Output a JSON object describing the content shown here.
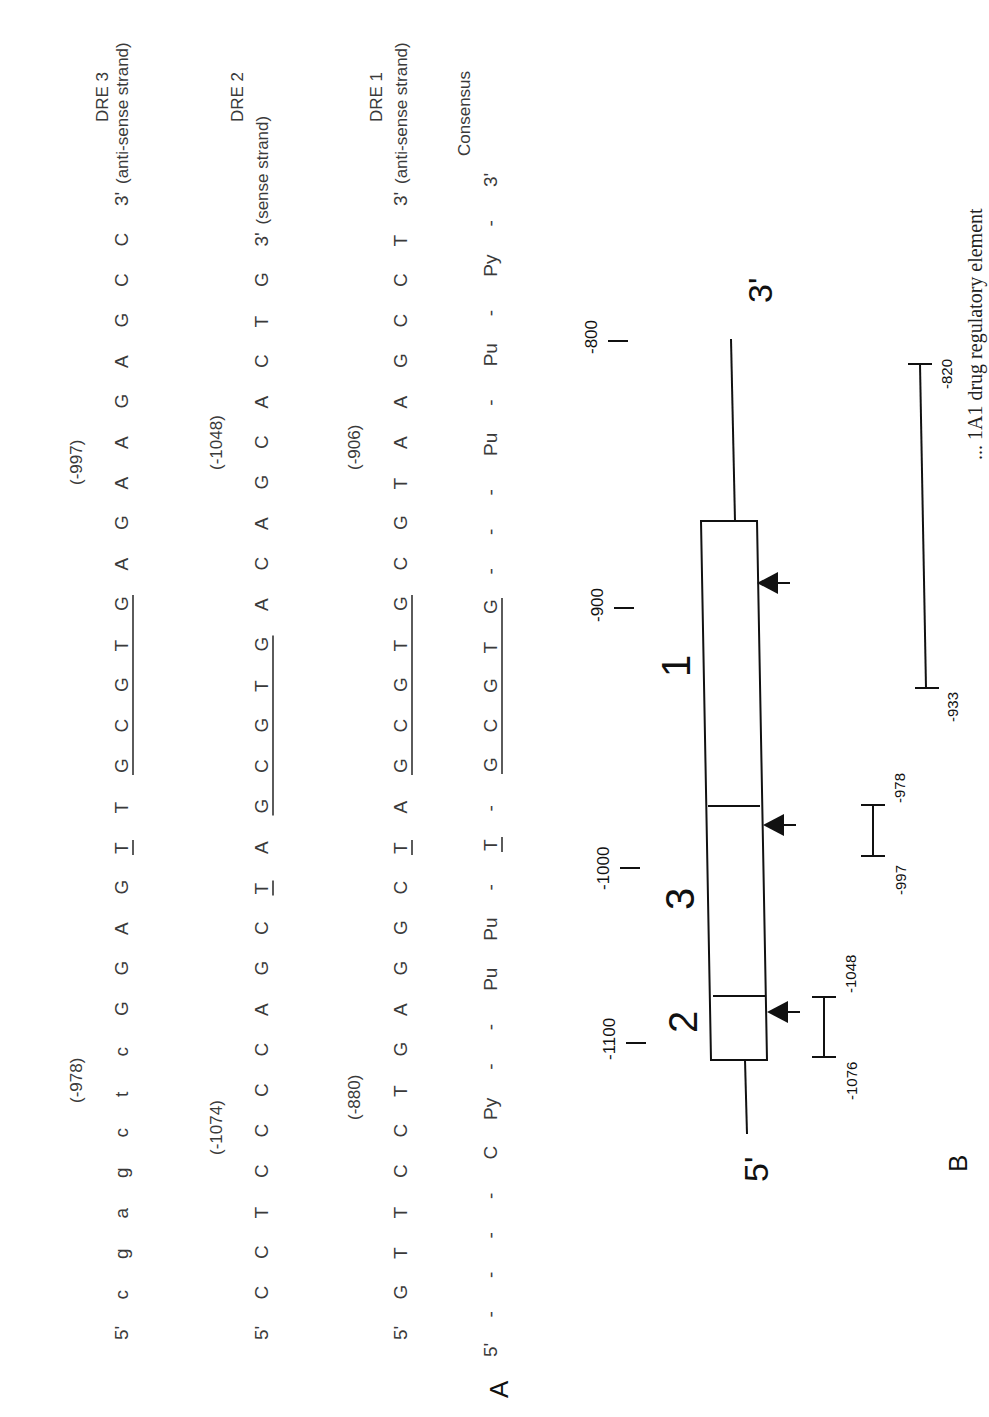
{
  "panel_a": {
    "label": "A",
    "rows": [
      {
        "name": "DRE 3",
        "prefix": "5'",
        "bases": [
          "c",
          "g",
          "a",
          "g",
          "c",
          "t",
          "c",
          "G",
          "G",
          "A",
          "G",
          "T",
          "T",
          "G",
          "C",
          "G",
          "T",
          "G",
          "A",
          "G",
          "A",
          "A",
          "G",
          "A",
          "G",
          "C",
          "C"
        ],
        "underlined_single_index": 11,
        "underlined_core": [
          13,
          17
        ],
        "suffix": "3'",
        "strand": "(anti-sense strand)",
        "pos_start": "(-978)",
        "pos_end": "(-997)"
      },
      {
        "name": "DRE 2",
        "prefix": "5'",
        "bases": [
          "C",
          "C",
          "T",
          "C",
          "C",
          "C",
          "C",
          "A",
          "G",
          "C",
          "T",
          "A",
          "G",
          "C",
          "G",
          "T",
          "G",
          "A",
          "C",
          "A",
          "G",
          "C",
          "A",
          "C",
          "T",
          "G"
        ],
        "underlined_single_index": 10,
        "underlined_core": [
          12,
          16
        ],
        "suffix": "3'",
        "strand": "(sense strand)",
        "pos_start": "(-1074)",
        "pos_end": "(-1048)"
      },
      {
        "name": "DRE 1",
        "prefix": "5'",
        "bases": [
          "G",
          "T",
          "T",
          "C",
          "C",
          "T",
          "G",
          "A",
          "G",
          "G",
          "C",
          "T",
          "A",
          "G",
          "C",
          "G",
          "T",
          "G",
          "C",
          "G",
          "T",
          "A",
          "A",
          "G",
          "C",
          "C",
          "T"
        ],
        "underlined_single_index": 11,
        "underlined_core": [
          13,
          17
        ],
        "suffix": "3'",
        "strand": "(anti-sense strand)",
        "pos_start": "(-880)",
        "pos_end": "(-906)"
      },
      {
        "name": "Consensus",
        "prefix": "5'",
        "bases": [
          "-",
          "-",
          "-",
          "-",
          "C",
          "Py",
          "-",
          "-",
          "Pu",
          "Pu",
          "-",
          "T",
          "-",
          "G",
          "C",
          "G",
          "T",
          "G",
          "-",
          "-",
          "-",
          "Pu",
          "-",
          "Pu",
          "-",
          "Py",
          "-"
        ],
        "underlined_single_index": 11,
        "underlined_core": [
          13,
          17
        ],
        "suffix": "3'",
        "strand": "",
        "pos_start": "",
        "pos_end": ""
      }
    ]
  },
  "panel_b": {
    "label": "B",
    "five_prime": "5'",
    "three_prime": "3'",
    "scale_ticks": [
      "-1100",
      "-1000",
      "-900",
      "-800"
    ],
    "elements": [
      {
        "number": "2",
        "fragment": [
          "-1076",
          "-1048"
        ]
      },
      {
        "number": "3",
        "fragment": [
          "-997",
          "-978"
        ]
      },
      {
        "number": "1",
        "fragment": [
          "-933",
          "-820"
        ]
      }
    ]
  },
  "caption": "... 1A1 drug regulatory element"
}
